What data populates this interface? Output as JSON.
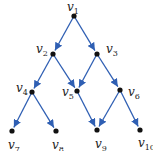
{
  "diagram": {
    "type": "directed-graph",
    "edge_color": "#2f5fb3",
    "node_color": "#111111",
    "nodes": [
      {
        "id": "v1",
        "base": "v",
        "sub": "1",
        "x": 74,
        "y": 16,
        "lx": 67,
        "ly": 11
      },
      {
        "id": "v2",
        "base": "v",
        "sub": "2",
        "x": 53,
        "y": 54,
        "lx": 36,
        "ly": 53
      },
      {
        "id": "v3",
        "base": "v",
        "sub": "3",
        "x": 97,
        "y": 54,
        "lx": 106,
        "ly": 53
      },
      {
        "id": "v4",
        "base": "v",
        "sub": "4",
        "x": 32,
        "y": 92,
        "lx": 16,
        "ly": 92
      },
      {
        "id": "v5",
        "base": "v",
        "sub": "5",
        "x": 77,
        "y": 91,
        "lx": 62,
        "ly": 96
      },
      {
        "id": "v6",
        "base": "v",
        "sub": "6",
        "x": 120,
        "y": 90,
        "lx": 128,
        "ly": 96
      },
      {
        "id": "v7",
        "base": "v",
        "sub": "7",
        "x": 12,
        "y": 131,
        "lx": 8,
        "ly": 149
      },
      {
        "id": "v8",
        "base": "v",
        "sub": "8",
        "x": 56,
        "y": 131,
        "lx": 52,
        "ly": 149
      },
      {
        "id": "v9",
        "base": "v",
        "sub": "9",
        "x": 97,
        "y": 130,
        "lx": 95,
        "ly": 148
      },
      {
        "id": "v10",
        "base": "v",
        "sub": "10",
        "x": 140,
        "y": 130,
        "lx": 138,
        "ly": 147
      }
    ],
    "edges": [
      {
        "from": "v1",
        "to": "v2"
      },
      {
        "from": "v1",
        "to": "v3"
      },
      {
        "from": "v2",
        "to": "v4"
      },
      {
        "from": "v2",
        "to": "v5"
      },
      {
        "from": "v3",
        "to": "v5"
      },
      {
        "from": "v3",
        "to": "v6"
      },
      {
        "from": "v4",
        "to": "v7"
      },
      {
        "from": "v4",
        "to": "v8"
      },
      {
        "from": "v5",
        "to": "v9"
      },
      {
        "from": "v6",
        "to": "v9"
      },
      {
        "from": "v6",
        "to": "v10"
      }
    ]
  }
}
